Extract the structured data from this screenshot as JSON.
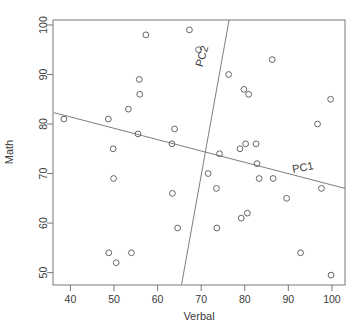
{
  "chart_data": {
    "type": "scatter",
    "title": "",
    "xlabel": "Verbal",
    "ylabel": "Math",
    "xlim": [
      36,
      103
    ],
    "ylim": [
      47.5,
      101
    ],
    "grid": false,
    "legend": "none",
    "xticks": [
      40,
      50,
      60,
      70,
      80,
      90,
      100
    ],
    "yticks": [
      50,
      60,
      70,
      80,
      90,
      100
    ],
    "xtick_labels": [
      "40",
      "50",
      "60",
      "70",
      "80",
      "90",
      "100"
    ],
    "ytick_labels": [
      "50",
      "60",
      "70",
      "80",
      "90",
      "100"
    ],
    "points": [
      {
        "x": 38.5,
        "y": 81
      },
      {
        "x": 48.7,
        "y": 81
      },
      {
        "x": 48.8,
        "y": 54
      },
      {
        "x": 49.8,
        "y": 75
      },
      {
        "x": 49.9,
        "y": 69
      },
      {
        "x": 50.5,
        "y": 52
      },
      {
        "x": 53.3,
        "y": 83
      },
      {
        "x": 54.0,
        "y": 54
      },
      {
        "x": 55.5,
        "y": 78
      },
      {
        "x": 55.8,
        "y": 89
      },
      {
        "x": 55.9,
        "y": 86
      },
      {
        "x": 57.3,
        "y": 98
      },
      {
        "x": 63.3,
        "y": 76
      },
      {
        "x": 63.4,
        "y": 66
      },
      {
        "x": 63.9,
        "y": 79
      },
      {
        "x": 64.6,
        "y": 59
      },
      {
        "x": 67.3,
        "y": 99
      },
      {
        "x": 69.4,
        "y": 95
      },
      {
        "x": 71.6,
        "y": 70
      },
      {
        "x": 73.5,
        "y": 67
      },
      {
        "x": 73.6,
        "y": 59
      },
      {
        "x": 74.2,
        "y": 74
      },
      {
        "x": 76.3,
        "y": 90
      },
      {
        "x": 78.9,
        "y": 75
      },
      {
        "x": 79.2,
        "y": 61
      },
      {
        "x": 79.8,
        "y": 87
      },
      {
        "x": 80.2,
        "y": 76
      },
      {
        "x": 80.6,
        "y": 62
      },
      {
        "x": 80.9,
        "y": 86
      },
      {
        "x": 82.6,
        "y": 76
      },
      {
        "x": 82.8,
        "y": 72
      },
      {
        "x": 83.3,
        "y": 69
      },
      {
        "x": 86.3,
        "y": 93
      },
      {
        "x": 86.5,
        "y": 69
      },
      {
        "x": 89.6,
        "y": 65
      },
      {
        "x": 92.8,
        "y": 54
      },
      {
        "x": 96.7,
        "y": 80
      },
      {
        "x": 97.6,
        "y": 67
      },
      {
        "x": 99.7,
        "y": 85
      },
      {
        "x": 99.8,
        "y": 49.5
      }
    ],
    "annotations": [
      {
        "label": "PC1",
        "x": 93.5,
        "y": 70.5,
        "rotation": -11
      },
      {
        "label": "PC2",
        "x": 71.0,
        "y": 93.5,
        "rotation": -74
      }
    ],
    "lines": [
      {
        "name": "PC1",
        "x1": 36.2,
        "y1": 82.3,
        "x2": 103.0,
        "y2": 67.0
      },
      {
        "name": "PC2",
        "x1": 65.5,
        "y1": 47.6,
        "x2": 76.4,
        "y2": 101.0
      }
    ]
  }
}
